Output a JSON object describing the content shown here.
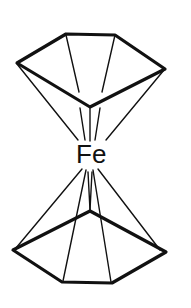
{
  "diagram": {
    "type": "chemical-structure",
    "molecule": "ferrocene",
    "central_atom": {
      "label": "Fe"
    },
    "rings": [
      {
        "name": "top-cyclopentadienyl-ring",
        "atoms": 5
      },
      {
        "name": "bottom-cyclopentadienyl-ring",
        "atoms": 5
      }
    ],
    "colors": {
      "line": "#111111",
      "background": "#ffffff"
    }
  }
}
